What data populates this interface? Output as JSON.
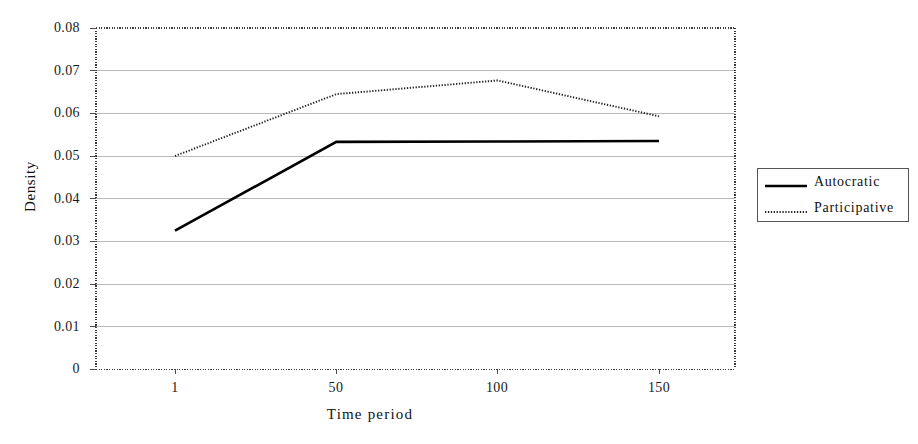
{
  "chart_data": {
    "type": "line",
    "title": "",
    "xlabel": "Time period",
    "ylabel": "Density",
    "x": [
      1,
      50,
      100,
      150
    ],
    "xtick_labels": [
      "1",
      "50",
      "100",
      "150"
    ],
    "ytick_labels": [
      "0",
      "0.01",
      "0.02",
      "0.03",
      "0.04",
      "0.05",
      "0.06",
      "0.07",
      "0.08"
    ],
    "ytick_values": [
      0,
      0.01,
      0.02,
      0.03,
      0.04,
      0.05,
      0.06,
      0.07,
      0.08
    ],
    "ylim": [
      0,
      0.08
    ],
    "xlim": [
      1,
      150
    ],
    "grid": "horizontal",
    "legend_position": "right",
    "series": [
      {
        "name": "Autocratic",
        "style": "solid",
        "color": "#000000",
        "values": [
          0.0325,
          0.0533,
          0.0534,
          0.0535
        ]
      },
      {
        "name": "Participative",
        "style": "dotted",
        "color": "#222222",
        "values": [
          0.05,
          0.0645,
          0.0677,
          0.0593
        ]
      }
    ]
  },
  "axes": {
    "y_label_text": "Density",
    "x_label_text": "Time period"
  },
  "legend": {
    "items": [
      {
        "label": "Autocratic",
        "style": "solid"
      },
      {
        "label": "Participative",
        "style": "dotted"
      }
    ]
  }
}
